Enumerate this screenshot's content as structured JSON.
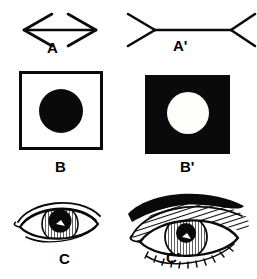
{
  "figure": {
    "background_color": "#ffffff",
    "ink_color": "#0a0a0a",
    "panels": [
      {
        "id": "A",
        "label": "A",
        "type": "muller-lyer-arrow",
        "description": "Horizontal line with inward-pointing arrowheads at both ends (double-headed arrow)",
        "fin_direction": "inward"
      },
      {
        "id": "A'",
        "label": "A'",
        "type": "muller-lyer-arrow",
        "description": "Horizontal line with outward-pointing fins at both ends (arrow tails)",
        "fin_direction": "outward"
      },
      {
        "id": "B",
        "label": "B",
        "type": "irradiation-square",
        "description": "Black circle centered on an outlined white square",
        "square_fill": "#ffffff",
        "square_stroke": "#0a0a0a",
        "circle_fill": "#0a0a0a"
      },
      {
        "id": "B'",
        "label": "B'",
        "type": "irradiation-square",
        "description": "White circle centered on a solid black square",
        "square_fill": "#0a0a0a",
        "square_stroke": "#0a0a0a",
        "circle_fill": "#fdfdfa"
      },
      {
        "id": "C",
        "label": "C",
        "type": "eye-drawing",
        "description": "Small line drawing of an eye with a large dark pupil, no eyebrow"
      },
      {
        "id": "C'",
        "label": "C'",
        "type": "eye-drawing",
        "description": "Larger line drawing of an eye with eyebrow and cross-hatched lid shading"
      }
    ],
    "labels": {
      "a": "A",
      "a_prime": "A'",
      "b": "B",
      "b_prime": "B'",
      "c": "C",
      "c_prime": "C'"
    }
  }
}
